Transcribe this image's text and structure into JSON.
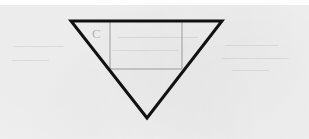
{
  "figure": {
    "background_color": "#f1f1f2",
    "top_strip_color": "#fdfdfd",
    "triangle": {
      "name": "inverted-triangle",
      "stroke_color": "#111111",
      "stroke_width": 3,
      "fill": "none",
      "orientation": "point-down",
      "vertices": [
        {
          "label": "top-left",
          "x": 71,
          "y": 21
        },
        {
          "label": "top-right",
          "x": 222,
          "y": 21
        },
        {
          "label": "apex",
          "x": 147,
          "y": 118
        }
      ]
    },
    "rectangle": {
      "name": "inscribed-rectangle",
      "stroke_color": "#9a9a9a",
      "stroke_width": 1,
      "fill": "none",
      "x": 110,
      "y": 21,
      "width": 72,
      "height": 48
    },
    "labels": [
      {
        "name": "vertex-label-c",
        "text": "C",
        "x": 92,
        "y": 38,
        "color": "#b4b4b4"
      }
    ],
    "bleed_through": {
      "note": "illegible scanned ink bleed-through",
      "lines": [
        "——————",
        "—————",
        "————",
        "—————",
        "———",
        "————",
        "———"
      ]
    }
  }
}
